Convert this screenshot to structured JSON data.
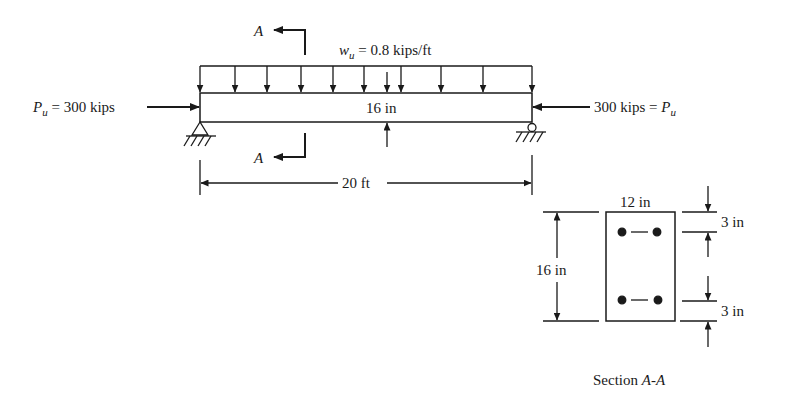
{
  "beam": {
    "load_label_w": "w",
    "load_label_sub": "u",
    "load_label_value": " = 0.8 kips/ft",
    "left_force_P": "P",
    "left_force_sub": "u",
    "left_force_value": " = 300 kips",
    "right_force_value": "300 kips = ",
    "right_force_P": "P",
    "right_force_sub": "u",
    "depth_label": "16 in",
    "span_label": "20 ft",
    "section_marker_top": "A",
    "section_marker_bottom": "A"
  },
  "section": {
    "width_label": "12 in",
    "height_label": "16 in",
    "top_cover_label": "3 in",
    "bottom_cover_label": "3 in",
    "caption_prefix": "Section ",
    "caption_name": "A-A"
  },
  "colors": {
    "ink": "#1a1a1a",
    "background": "#ffffff"
  }
}
